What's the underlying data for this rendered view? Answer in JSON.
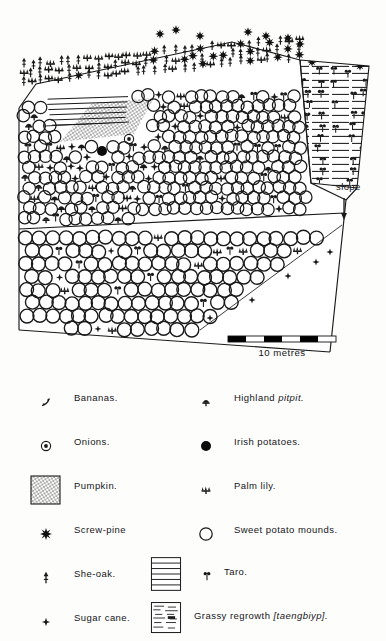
{
  "figure": {
    "type": "hand-drawn garden plan map",
    "title_visible": false,
    "slope_label": "slope",
    "scale": {
      "caption": "10 metres",
      "segments": 6,
      "bar_colors": [
        "#000000",
        "#ffffff"
      ]
    },
    "colors": {
      "ink": "#111111",
      "paper": "#fdfdfc",
      "fill_solid": "#000000"
    }
  },
  "legend": {
    "left_column": [
      {
        "symbol": "banana-icon",
        "label": "Bananas."
      },
      {
        "symbol": "onion-icon",
        "label": "Onions."
      },
      {
        "symbol": "pumpkin-icon",
        "label": "Pumpkin."
      },
      {
        "symbol": "screw-pine-icon",
        "label": "Screw-pine"
      },
      {
        "symbol": "she-oak-icon",
        "label": "She-oak."
      },
      {
        "symbol": "sugar-cane-icon",
        "label": "Sugar cane."
      }
    ],
    "right_column": [
      {
        "symbol": "highland-pitpit-icon",
        "label_plain": "Highland ",
        "label_italic": "pitpit."
      },
      {
        "symbol": "irish-potato-icon",
        "label_plain": "Irish potatoes.",
        "label_italic": ""
      },
      {
        "symbol": "palm-lily-icon",
        "label_plain": "Palm lily.",
        "label_italic": ""
      },
      {
        "symbol": "sweet-potato-mound-icon",
        "label_plain": "Sweet potato mounds.",
        "label_italic": ""
      },
      {
        "symbol": "taro-icon",
        "label_plain": "Taro.",
        "label_italic": ""
      },
      {
        "symbol": "grassy-regrowth-icon",
        "label_plain": "Grassy regrowth ",
        "label_italic": "[taengbiyp]."
      }
    ]
  },
  "map_regions": [
    {
      "name": "upper-boundary-planting-strip",
      "contents": "palm lily and she-oak row with screw-pines"
    },
    {
      "name": "taro-strip-upper-left",
      "contents": "horizontal hatched taro beds"
    },
    {
      "name": "pumpkin-patch",
      "contents": "stippled pumpkin area"
    },
    {
      "name": "upper-mixed-garden",
      "contents": "sweet potato mounds with taro, palm lily, pitpit, sugar cane, onions, irish potatoes"
    },
    {
      "name": "lower-sweet-potato-field",
      "contents": "regular grid of sweet potato mounds"
    },
    {
      "name": "right-taro-block",
      "contents": "dense hatched taro plot"
    }
  ]
}
